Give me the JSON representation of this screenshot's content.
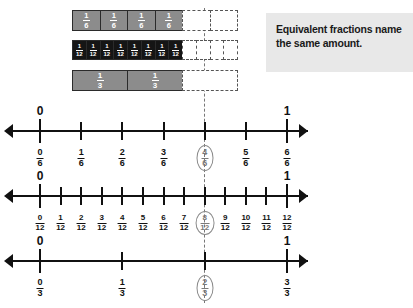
{
  "callout": {
    "line1": "Equivalent fractions name",
    "line2": "the same amount.",
    "background": "#e8e8e8"
  },
  "bars": [
    {
      "name": "sixths",
      "denominator": 6,
      "total_cells": 6,
      "filled_cells": 4,
      "fill_color": "#8c8c8c",
      "label_num": "1",
      "label_den": "6"
    },
    {
      "name": "twelfths",
      "denominator": 12,
      "total_cells": 12,
      "filled_cells": 8,
      "fill_color": "#151515",
      "label_num": "1",
      "label_den": "12"
    },
    {
      "name": "thirds",
      "denominator": 3,
      "total_cells": 3,
      "filled_cells": 2,
      "fill_color": "#8c8c8c",
      "label_num": "1",
      "label_den": "3"
    }
  ],
  "numberlines": [
    {
      "name": "sixths",
      "denominator": 6,
      "start_label": "0",
      "end_label": "1",
      "highlighted_index": 4,
      "ticks": [
        {
          "num": "0",
          "den": "6"
        },
        {
          "num": "1",
          "den": "6"
        },
        {
          "num": "2",
          "den": "6"
        },
        {
          "num": "3",
          "den": "6"
        },
        {
          "num": "4",
          "den": "6"
        },
        {
          "num": "5",
          "den": "6"
        },
        {
          "num": "6",
          "den": "6"
        }
      ]
    },
    {
      "name": "twelfths",
      "denominator": 12,
      "start_label": "0",
      "end_label": "1",
      "highlighted_index": 8,
      "ticks": [
        {
          "num": "0",
          "den": "12"
        },
        {
          "num": "1",
          "den": "12"
        },
        {
          "num": "2",
          "den": "12"
        },
        {
          "num": "3",
          "den": "12"
        },
        {
          "num": "4",
          "den": "12"
        },
        {
          "num": "5",
          "den": "12"
        },
        {
          "num": "6",
          "den": "12"
        },
        {
          "num": "7",
          "den": "12"
        },
        {
          "num": "8",
          "den": "12"
        },
        {
          "num": "9",
          "den": "12"
        },
        {
          "num": "10",
          "den": "12"
        },
        {
          "num": "11",
          "den": "12"
        },
        {
          "num": "12",
          "den": "12"
        }
      ]
    },
    {
      "name": "thirds",
      "denominator": 3,
      "start_label": "0",
      "end_label": "1",
      "highlighted_index": 2,
      "ticks": [
        {
          "num": "0",
          "den": "3"
        },
        {
          "num": "1",
          "den": "3"
        },
        {
          "num": "2",
          "den": "3"
        },
        {
          "num": "3",
          "den": "3"
        }
      ]
    }
  ],
  "guide_line": {
    "color": "#777777",
    "style": "dashed"
  }
}
